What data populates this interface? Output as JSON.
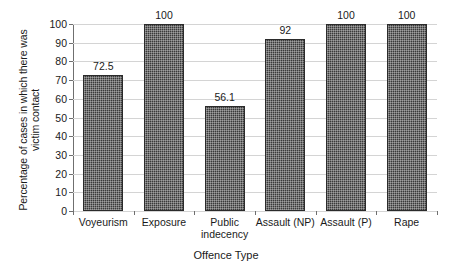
{
  "chart_data": {
    "type": "bar",
    "title": "",
    "xlabel": "Offence Type",
    "ylabel": "Percentage of cases in which there was victim contact",
    "ylabel_lines": [
      "Percentage of cases in which there was",
      "victim contact"
    ],
    "categories": [
      "Voyeurism",
      "Exposure",
      "Public indecency",
      "Assault (NP)",
      "Assault (P)",
      "Rape"
    ],
    "category_label_lines": [
      [
        "Voyeurism"
      ],
      [
        "Exposure"
      ],
      [
        "Public",
        "indecency"
      ],
      [
        "Assault (NP)"
      ],
      [
        "Assault (P)"
      ],
      [
        "Rape"
      ]
    ],
    "values": [
      72.5,
      100,
      56.1,
      92,
      100,
      100
    ],
    "value_labels": [
      "72.5",
      "100",
      "56.1",
      "92",
      "100",
      "100"
    ],
    "ylim": [
      0,
      100
    ],
    "ytick_step": 10,
    "ytick_labels": [
      "100",
      "90",
      "80",
      "70",
      "60",
      "50",
      "40",
      "30",
      "20",
      "10",
      "0"
    ],
    "grid": true,
    "grid_axis": "y",
    "legend": false,
    "legend_position": "none",
    "colors": {
      "bar_fill": "#3a3a3a",
      "bar_edge": "#2b2b2b",
      "gridline": "#d4d4d4",
      "axis": "#6f6f6f",
      "text": "#1a1a1a",
      "background": "#ffffff"
    }
  }
}
